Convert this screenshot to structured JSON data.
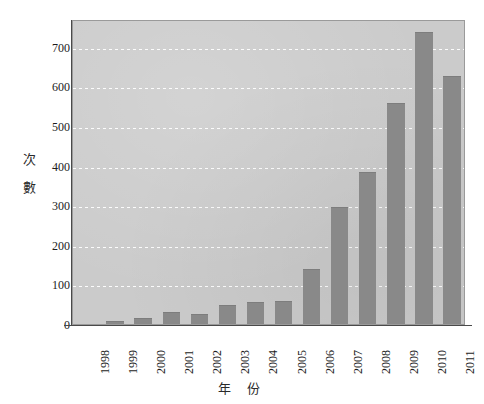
{
  "chart_data": {
    "type": "bar",
    "title": "",
    "subtitle": "",
    "xlabel": "年 份",
    "ylabel_chars": [
      "次",
      "數"
    ],
    "ylabel": "次數",
    "categories": [
      "1998",
      "1999",
      "2000",
      "2001",
      "2002",
      "2003",
      "2004",
      "2005",
      "2006",
      "2007",
      "2008",
      "2009",
      "2010",
      "2011"
    ],
    "values": [
      0,
      8,
      15,
      30,
      25,
      48,
      55,
      58,
      138,
      295,
      383,
      557,
      737,
      625
    ],
    "ylim": [
      0,
      770
    ],
    "y_ticks": [
      0,
      100,
      200,
      300,
      400,
      500,
      600,
      700
    ],
    "y_tick_labels": [
      "0",
      "100",
      "200",
      "300",
      "400",
      "500",
      "600",
      "700"
    ],
    "grid": true,
    "grid_style": "dotted-white-horizontal",
    "legend": "none",
    "x_tick_rotation": 90,
    "bar_color": "#898989",
    "plot_background": "#cbcbcb",
    "gridline_color": "#ffffff",
    "axis_color": "#4a4a4a",
    "text_color": "#1c1c1c",
    "page_background": "#ffffff"
  }
}
